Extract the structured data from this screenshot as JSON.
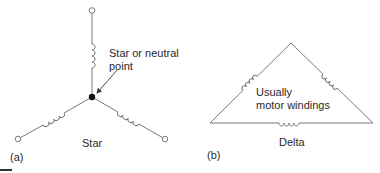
{
  "diagram": {
    "type": "electrical-connections",
    "colors": {
      "wire": "#7a7a7a",
      "text": "#2a2a2a",
      "node": "#111111",
      "background": "#ffffff"
    },
    "panels": [
      {
        "id": "a",
        "caption": "(a)",
        "title": "Star",
        "annotation_line1": "Star or neutral",
        "annotation_line2": "point",
        "elements": {
          "neutral_node": "filled-dot",
          "terminals": 3,
          "windings": 3,
          "arrow": "points to neutral node"
        }
      },
      {
        "id": "b",
        "caption": "(b)",
        "title": "Delta",
        "annotation_line1": "Usually",
        "annotation_line2": "motor windings",
        "elements": {
          "shape": "triangle",
          "windings": 3
        }
      }
    ]
  }
}
